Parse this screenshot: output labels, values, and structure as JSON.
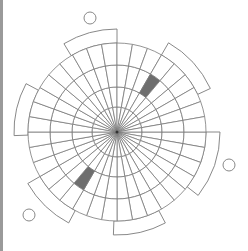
{
  "board": {
    "center": [
      117,
      132
    ],
    "ring_radii": [
      0,
      25,
      45,
      67,
      89
    ],
    "spoke_count": 36,
    "tab_outer_radius": 103,
    "colors": {
      "line": "#7a7a7a",
      "shaded": "#6e6e6e",
      "background": "#ffffff",
      "sidebar_rule": "#9a9a9a"
    },
    "shaded_cells": [
      {
        "ring": 3,
        "sector": 30
      },
      {
        "ring": 3,
        "sector": 12
      }
    ],
    "tabs": [
      {
        "start_deg": -121,
        "end_deg": -90,
        "marker": [
          90,
          18
        ]
      },
      {
        "start_deg": -60,
        "end_deg": -25,
        "marker": null
      },
      {
        "start_deg": 0,
        "end_deg": 38,
        "marker": [
          229,
          165
        ]
      },
      {
        "start_deg": 62,
        "end_deg": 92,
        "marker": null
      },
      {
        "start_deg": 118,
        "end_deg": 150,
        "marker": [
          29,
          215
        ]
      },
      {
        "start_deg": 178,
        "end_deg": 208,
        "marker": null
      }
    ],
    "marker_radius": 6
  }
}
